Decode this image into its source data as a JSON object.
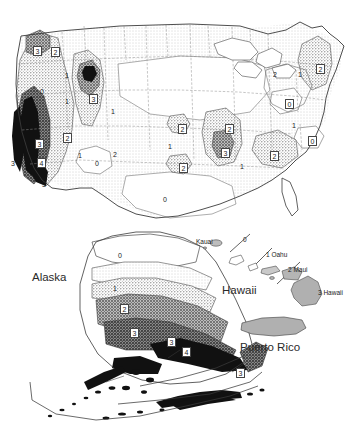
{
  "figure": {
    "type": "seismic-hazard-contour-map",
    "levels": [
      0,
      1,
      2,
      3,
      4
    ],
    "palette": {
      "level0": "#ffffff",
      "level1": "#e8e8e8",
      "level2": "#c6c6c6",
      "level3": "#9a9a9a",
      "level3b": "#6e6e6e",
      "level4": "#111111",
      "outline": "#4a4a4a",
      "state_border": "#8a8a8a",
      "text": "#1b1b1b"
    }
  },
  "panels": {
    "conus": {
      "name": "Contiguous United States",
      "labels": [
        {
          "text": "3",
          "x": 33,
          "y": 46,
          "boxed": true
        },
        {
          "text": "2",
          "x": 51,
          "y": 47,
          "boxed": true
        },
        {
          "text": "0",
          "x": 40,
          "y": 88,
          "boxed": false
        },
        {
          "text": "1",
          "x": 65,
          "y": 72,
          "boxed": false
        },
        {
          "text": "1",
          "x": 65,
          "y": 98,
          "boxed": false
        },
        {
          "text": "3",
          "x": 89,
          "y": 94,
          "boxed": true
        },
        {
          "text": "1",
          "x": 111,
          "y": 108,
          "boxed": false
        },
        {
          "text": "2",
          "x": 63,
          "y": 133,
          "boxed": true
        },
        {
          "text": "3",
          "x": 35,
          "y": 139,
          "boxed": true
        },
        {
          "text": "4",
          "x": 37,
          "y": 158,
          "boxed": true
        },
        {
          "text": "3",
          "x": 11,
          "y": 160,
          "boxed": false
        },
        {
          "text": "3",
          "x": 42,
          "y": 181,
          "boxed": false
        },
        {
          "text": "1",
          "x": 78,
          "y": 152,
          "boxed": false
        },
        {
          "text": "0",
          "x": 95,
          "y": 160,
          "boxed": false
        },
        {
          "text": "2",
          "x": 113,
          "y": 151,
          "boxed": false
        },
        {
          "text": "1",
          "x": 168,
          "y": 143,
          "boxed": false
        },
        {
          "text": "2",
          "x": 178,
          "y": 124,
          "boxed": true
        },
        {
          "text": "2",
          "x": 179,
          "y": 163,
          "boxed": true
        },
        {
          "text": "2",
          "x": 225,
          "y": 124,
          "boxed": true
        },
        {
          "text": "3",
          "x": 221,
          "y": 148,
          "boxed": true
        },
        {
          "text": "1",
          "x": 240,
          "y": 163,
          "boxed": false
        },
        {
          "text": "0",
          "x": 163,
          "y": 196,
          "boxed": false
        },
        {
          "text": "2",
          "x": 273,
          "y": 71,
          "boxed": false
        },
        {
          "text": "1",
          "x": 298,
          "y": 71,
          "boxed": false
        },
        {
          "text": "2",
          "x": 316,
          "y": 64,
          "boxed": true
        },
        {
          "text": "0",
          "x": 285,
          "y": 99,
          "boxed": true
        },
        {
          "text": "1",
          "x": 292,
          "y": 122,
          "boxed": false
        },
        {
          "text": "0",
          "x": 308,
          "y": 136,
          "boxed": true
        },
        {
          "text": "2",
          "x": 270,
          "y": 151,
          "boxed": true
        }
      ]
    },
    "alaska": {
      "name": "Alaska",
      "title": "Alaska",
      "title_x": 32,
      "title_y": 278,
      "labels": [
        {
          "text": "0",
          "x": 118,
          "y": 252,
          "boxed": false
        },
        {
          "text": "1",
          "x": 113,
          "y": 285,
          "boxed": false
        },
        {
          "text": "2",
          "x": 120,
          "y": 304,
          "boxed": true
        },
        {
          "text": "3",
          "x": 130,
          "y": 328,
          "boxed": true
        },
        {
          "text": "3",
          "x": 167,
          "y": 337,
          "boxed": true
        },
        {
          "text": "4",
          "x": 182,
          "y": 347,
          "boxed": true
        },
        {
          "text": "3",
          "x": 236,
          "y": 368,
          "boxed": true
        }
      ]
    },
    "hawaii": {
      "name": "Hawaii",
      "title": "Hawaii",
      "title_x": 222,
      "title_y": 291,
      "islands": [
        {
          "text": "Kauai",
          "x": 196,
          "y": 239
        },
        {
          "text": "0",
          "x": 243,
          "y": 237
        },
        {
          "text": "1 Oahu",
          "x": 266,
          "y": 252
        },
        {
          "text": "2 Maui",
          "x": 288,
          "y": 267
        },
        {
          "text": "3 Hawaii",
          "x": 318,
          "y": 290
        }
      ]
    },
    "puerto_rico": {
      "name": "Puerto Rico",
      "title": "Puerto Rico",
      "title_x": 263,
      "title_y": 348
    }
  }
}
